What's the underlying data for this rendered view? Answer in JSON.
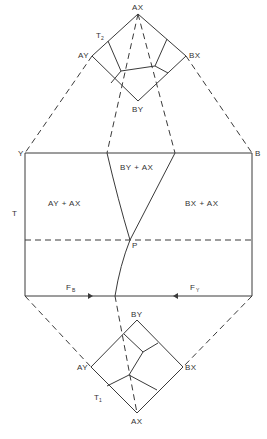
{
  "diagram": {
    "type": "phase-diagram-projection",
    "top_triangle": {
      "label": "T",
      "label_sub": "2",
      "vertices": {
        "top": "AX",
        "left": "AY",
        "right": "BX",
        "bottom": "BY"
      }
    },
    "main_field": {
      "corner_top_left": "Y",
      "corner_top_right": "B",
      "axis_label": "T",
      "regions": [
        {
          "id": "left",
          "label": "AY + AX"
        },
        {
          "id": "middle",
          "label": "BY + AX"
        },
        {
          "id": "right",
          "label": "BX + AX"
        }
      ],
      "point_label": "P",
      "flux_left": {
        "label": "F",
        "sub": "B"
      },
      "flux_right": {
        "label": "F",
        "sub": "Y"
      }
    },
    "bottom_triangle": {
      "label": "T",
      "label_sub": "1",
      "vertices": {
        "top": "BY",
        "left": "AY",
        "right": "BX",
        "bottom": "AX"
      }
    }
  },
  "colors": {
    "line": "#3a3a3a",
    "text": "#333333",
    "background": "#ffffff"
  }
}
